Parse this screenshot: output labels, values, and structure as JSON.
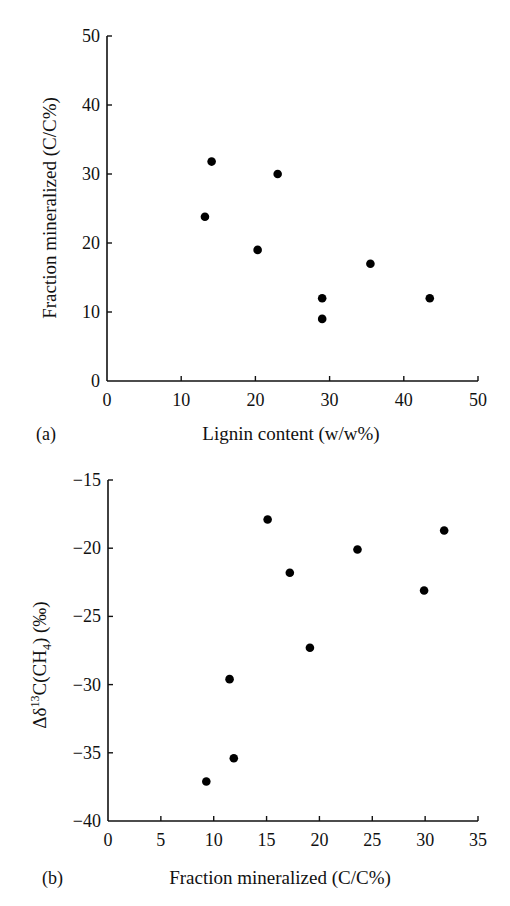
{
  "chart_data": [
    {
      "type": "scatter",
      "panel_label": "(a)",
      "title": "",
      "xlabel": "Lignin content (w/w%)",
      "ylabel": "Fraction mineralized (C/C%)",
      "xlim": [
        0,
        50
      ],
      "ylim": [
        0,
        50
      ],
      "xticks": [
        "0",
        "10",
        "20",
        "30",
        "40",
        "50"
      ],
      "yticks": [
        "0",
        "10",
        "20",
        "30",
        "40",
        "50"
      ],
      "grid": false,
      "legend": null,
      "points": [
        {
          "x": 13.2,
          "y": 23.8
        },
        {
          "x": 14.1,
          "y": 31.8
        },
        {
          "x": 20.3,
          "y": 19.0
        },
        {
          "x": 23.0,
          "y": 30.0
        },
        {
          "x": 29.0,
          "y": 12.0
        },
        {
          "x": 29.0,
          "y": 9.0
        },
        {
          "x": 35.5,
          "y": 17.0
        },
        {
          "x": 43.5,
          "y": 12.0
        }
      ],
      "marker_color": "#000000"
    },
    {
      "type": "scatter",
      "panel_label": "(b)",
      "title": "",
      "xlabel": "Fraction mineralized (C/C%)",
      "ylabel": "Δδ13C(CH4) (‰)",
      "ylabel_parts": {
        "prefix": "Δδ",
        "sup": "13",
        "mid": "C(CH",
        "sub": "4",
        "suffix": ") (‰)"
      },
      "xlim": [
        0,
        35
      ],
      "ylim": [
        -40,
        -15
      ],
      "xticks": [
        "0",
        "5",
        "10",
        "15",
        "20",
        "25",
        "30",
        "35"
      ],
      "yticks": [
        "−40",
        "−35",
        "−30",
        "−25",
        "−20",
        "−15"
      ],
      "grid": false,
      "legend": null,
      "points": [
        {
          "x": 9.3,
          "y": -37.1
        },
        {
          "x": 11.5,
          "y": -29.6
        },
        {
          "x": 11.9,
          "y": -35.4
        },
        {
          "x": 15.1,
          "y": -17.9
        },
        {
          "x": 17.2,
          "y": -21.8
        },
        {
          "x": 19.1,
          "y": -27.3
        },
        {
          "x": 23.6,
          "y": -20.1
        },
        {
          "x": 29.9,
          "y": -23.1
        },
        {
          "x": 31.8,
          "y": -18.7
        }
      ],
      "marker_color": "#000000"
    }
  ]
}
